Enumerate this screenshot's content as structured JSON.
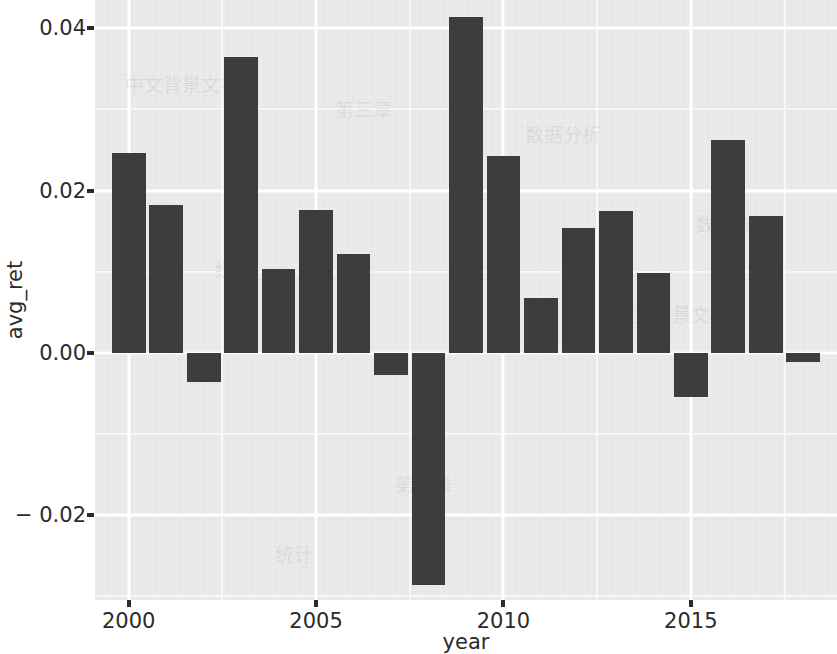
{
  "chart_data": {
    "type": "bar",
    "title": "",
    "subtitle": "",
    "xlabel": "year",
    "ylabel": "avg_ret",
    "x": [
      2000,
      2001,
      2002,
      2003,
      2004,
      2005,
      2006,
      2007,
      2008,
      2009,
      2010,
      2011,
      2012,
      2013,
      2014,
      2015,
      2016,
      2017,
      2018
    ],
    "categories": [
      "2000",
      "2001",
      "2002",
      "2003",
      "2004",
      "2005",
      "2006",
      "2007",
      "2008",
      "2009",
      "2010",
      "2011",
      "2012",
      "2013",
      "2014",
      "2015",
      "2016",
      "2017",
      "2018"
    ],
    "values": [
      0.0246,
      0.0182,
      -0.0036,
      0.0365,
      0.0103,
      0.0176,
      0.0122,
      -0.0028,
      -0.0286,
      0.0414,
      0.0243,
      0.0068,
      0.0154,
      0.0175,
      0.0098,
      -0.0055,
      0.0262,
      0.0169,
      -0.0012
    ],
    "series": [
      {
        "name": "avg_ret",
        "values": [
          0.0246,
          0.0182,
          -0.0036,
          0.0365,
          0.0103,
          0.0176,
          0.0122,
          -0.0028,
          -0.0286,
          0.0414,
          0.0243,
          0.0068,
          0.0154,
          0.0175,
          0.0098,
          -0.0055,
          0.0262,
          0.0169,
          -0.0012
        ]
      }
    ],
    "xlim": [
      1999.1,
      2018.9
    ],
    "ylim": [
      -0.0305,
      0.0435
    ],
    "y_ticks": [
      0.04,
      0.02,
      0.0,
      -0.02
    ],
    "y_tick_labels": [
      "0.04",
      "0.02",
      "0.00",
      "− 0.02"
    ],
    "y_minor_ticks": [
      0.03,
      0.01,
      -0.01,
      -0.03
    ],
    "x_ticks": [
      2000,
      2005,
      2010,
      2015
    ],
    "x_tick_labels": [
      "2000",
      "2005",
      "2010",
      "2015"
    ],
    "x_minor_ticks": [
      2002.5,
      2007.5,
      2012.5,
      2017.5
    ],
    "grid": true,
    "legend": false,
    "legend_position": "none",
    "bar_color": "#3d3d3d",
    "panel_color": "#ebebeb",
    "grid_color": "#ffffff",
    "text_color": "#2b2b2b"
  },
  "axes": {
    "y_title": "avg_ret",
    "x_title": "year"
  },
  "background_text": [
    "中文背景文字",
    "第三章",
    "数据分析",
    "统计"
  ]
}
